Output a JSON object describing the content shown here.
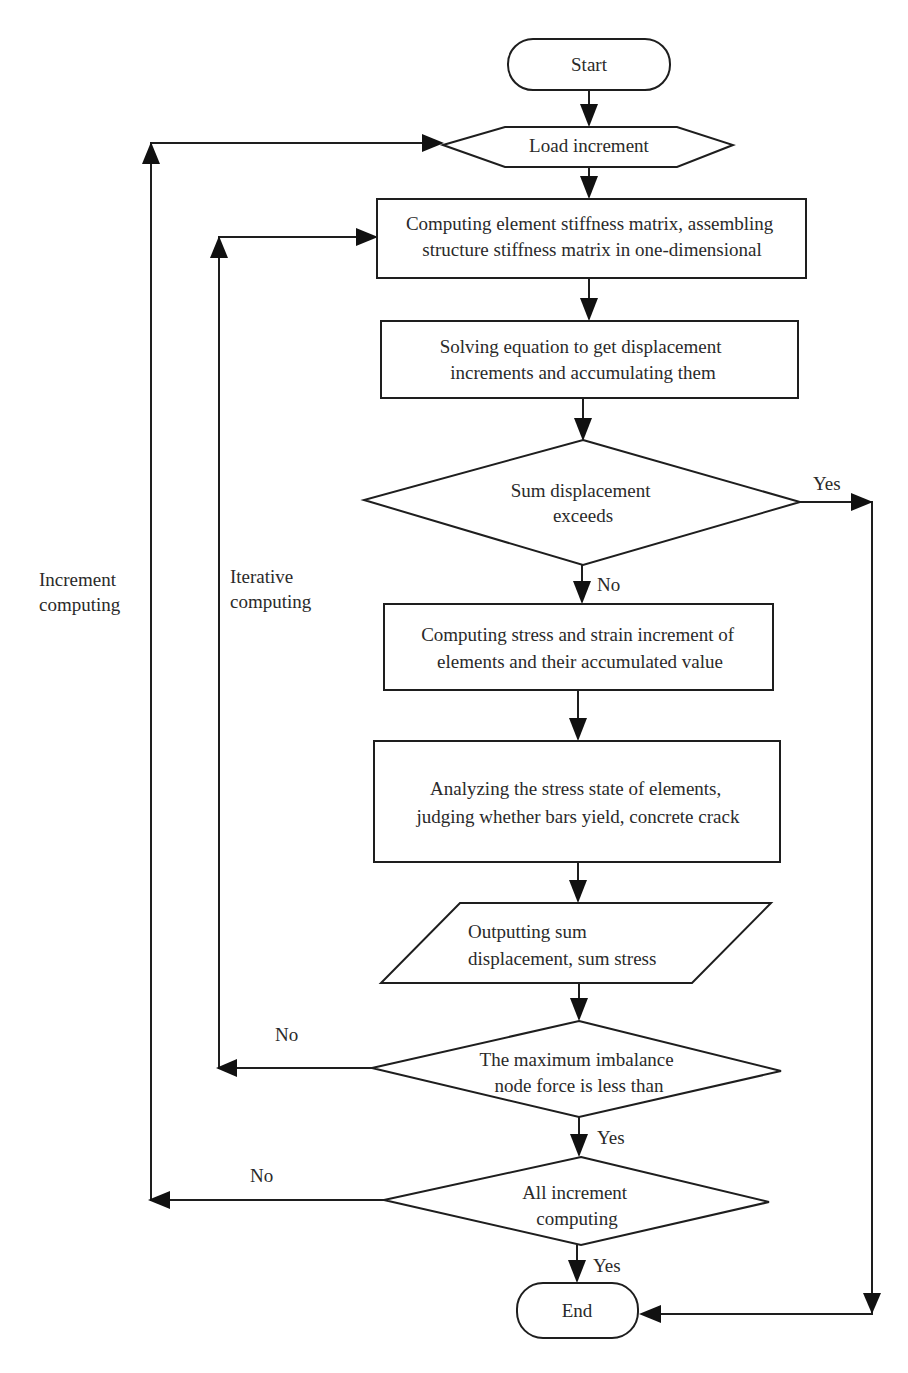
{
  "diagram": {
    "type": "flowchart",
    "nodes": {
      "start": {
        "shape": "terminator",
        "lines": [
          "Start"
        ]
      },
      "load_increment": {
        "shape": "hexagon",
        "lines": [
          "Load increment"
        ]
      },
      "stiffness": {
        "shape": "process",
        "lines": [
          "Computing element stiffness matrix, assembling",
          "structure stiffness matrix in one-dimensional"
        ]
      },
      "solve": {
        "shape": "process",
        "lines": [
          "Solving equation to get displacement",
          "increments and accumulating them"
        ]
      },
      "check_displacement": {
        "shape": "decision",
        "lines": [
          "Sum displacement",
          "exceeds"
        ]
      },
      "stress_strain": {
        "shape": "process",
        "lines": [
          "Computing stress and strain increment of",
          "elements and their accumulated value"
        ]
      },
      "analyze": {
        "shape": "process",
        "lines": [
          "Analyzing the stress state of elements,",
          "judging whether bars yield, concrete crack"
        ]
      },
      "output": {
        "shape": "io",
        "lines": [
          "Outputting sum",
          "displacement, sum stress"
        ]
      },
      "check_imbalance": {
        "shape": "decision",
        "lines": [
          "The maximum imbalance",
          "node force is less than"
        ]
      },
      "check_all": {
        "shape": "decision",
        "lines": [
          "All increment",
          "computing"
        ]
      },
      "end": {
        "shape": "terminator",
        "lines": [
          "End"
        ]
      }
    },
    "edge_labels": {
      "displacement_yes": "Yes",
      "displacement_no": "No",
      "imbalance_no": "No",
      "imbalance_yes": "Yes",
      "all_no": "No",
      "all_yes": "Yes"
    },
    "loop_labels": {
      "increment": [
        "Increment",
        "computing"
      ],
      "iterative": [
        "Iterative",
        "computing"
      ]
    },
    "edges": [
      {
        "from": "start",
        "to": "load_increment"
      },
      {
        "from": "load_increment",
        "to": "stiffness"
      },
      {
        "from": "stiffness",
        "to": "solve"
      },
      {
        "from": "solve",
        "to": "check_displacement"
      },
      {
        "from": "check_displacement",
        "to": "stress_strain",
        "label": "No"
      },
      {
        "from": "check_displacement",
        "to": "end",
        "label": "Yes"
      },
      {
        "from": "stress_strain",
        "to": "analyze"
      },
      {
        "from": "analyze",
        "to": "output"
      },
      {
        "from": "output",
        "to": "check_imbalance"
      },
      {
        "from": "check_imbalance",
        "to": "stiffness",
        "label": "No",
        "loop": "Iterative computing"
      },
      {
        "from": "check_imbalance",
        "to": "check_all",
        "label": "Yes"
      },
      {
        "from": "check_all",
        "to": "load_increment",
        "label": "No",
        "loop": "Increment computing"
      },
      {
        "from": "check_all",
        "to": "end",
        "label": "Yes"
      }
    ]
  }
}
